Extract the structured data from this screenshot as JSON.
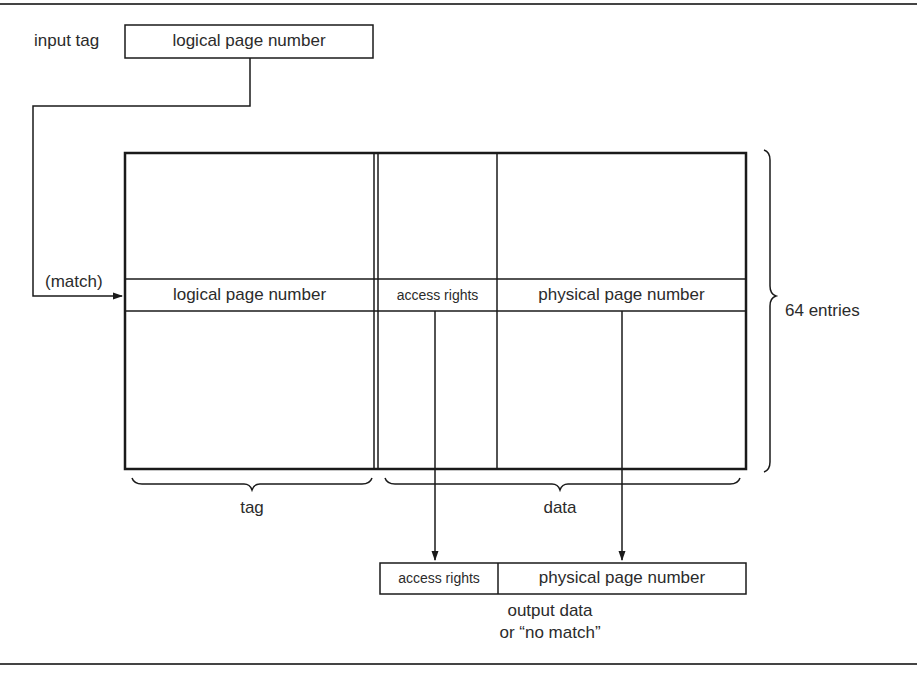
{
  "diagram": {
    "input": {
      "label": "input tag",
      "field": "logical page number"
    },
    "match_label": "(match)",
    "table": {
      "columns": [
        {
          "name": "logical page number",
          "group": "tag"
        },
        {
          "name": "access rights",
          "group": "data"
        },
        {
          "name": "physical page number",
          "group": "data"
        }
      ],
      "entries_label": "64 entries",
      "groups": {
        "tag": "tag",
        "data": "data"
      }
    },
    "output": {
      "fields": [
        "access rights",
        "physical page number"
      ],
      "caption_line1": "output data",
      "caption_line2": "or “no match”"
    },
    "colors": {
      "line": "#1a1a1a",
      "text": "#2b2b2b",
      "background": "#ffffff"
    }
  }
}
